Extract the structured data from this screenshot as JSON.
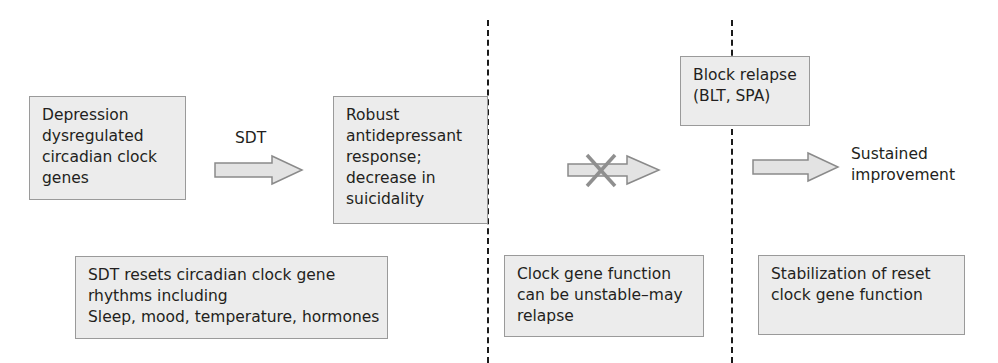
{
  "diagram": {
    "boxes": {
      "depression": {
        "lines": [
          "Depression",
          "dysregulated",
          "circadian clock",
          "genes"
        ]
      },
      "response": {
        "lines": [
          "Robust",
          "antidepressant",
          "response;",
          "decrease in",
          "suicidality"
        ]
      },
      "block_relapse": {
        "lines": [
          "Block relapse",
          "(BLT, SPA)"
        ]
      },
      "sdt_resets": {
        "lines": [
          "SDT resets circadian clock gene",
          "rhythms including",
          "Sleep, mood, temperature, hormones"
        ]
      },
      "unstable": {
        "lines": [
          "Clock gene function",
          "can be unstable–may",
          "relapse"
        ]
      },
      "stabilization": {
        "lines": [
          "Stabilization of reset",
          "clock gene function"
        ]
      }
    },
    "arrows": {
      "sdt": {
        "label": "SDT"
      },
      "blocked": {
        "label": "",
        "crossed": true
      },
      "sustained": {
        "label": ""
      }
    },
    "outcome_label": {
      "lines": [
        "Sustained",
        "improvement"
      ]
    },
    "colors": {
      "box_fill": "#ececec",
      "box_border": "#9a9a9a",
      "arrow_fill": "#e3e3e3",
      "arrow_stroke": "#8a8a8a",
      "cross": "#8f8f8f",
      "divider": "#1a1a1a"
    }
  }
}
